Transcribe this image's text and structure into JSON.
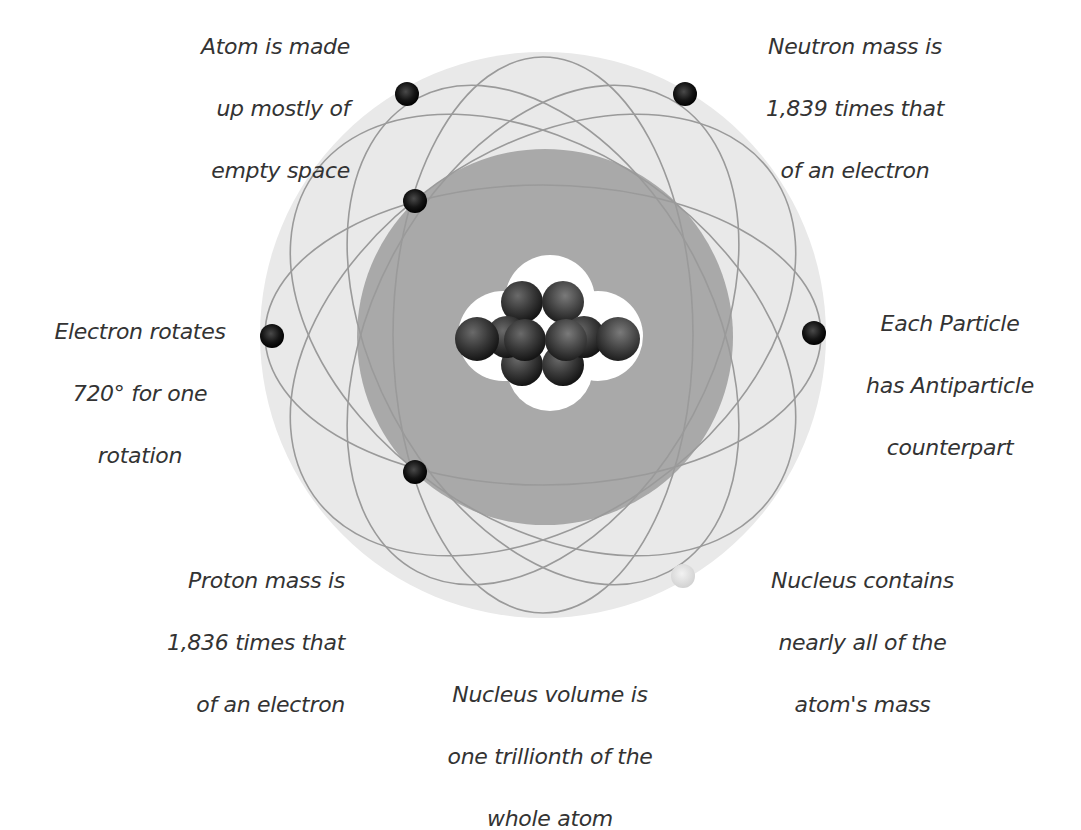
{
  "diagram": {
    "colors": {
      "background": "#ffffff",
      "outer_cloud": "#e9e9e9",
      "inner_cloud": "#a8a8a8",
      "orbit_line": "#9a9a9a",
      "nucleus_halo": "#ffffff",
      "particle": "#2a2a2a",
      "electron": "#111111",
      "faded_electron": "#dcdcdc",
      "text": "#333333"
    },
    "captions": [
      {
        "id": "empty-space",
        "lines": [
          "Atom is made",
          "up mostly of",
          "empty space"
        ]
      },
      {
        "id": "neutron-mass",
        "lines": [
          "Neutron mass is",
          "1,839 times that",
          "of an electron"
        ]
      },
      {
        "id": "electron-rotation",
        "lines": [
          "Electron rotates",
          "720° for one",
          "rotation"
        ]
      },
      {
        "id": "antiparticle",
        "lines": [
          "Each Particle",
          "has Antiparticle",
          "counterpart"
        ]
      },
      {
        "id": "proton-mass",
        "lines": [
          "Proton mass is",
          "1,836 times that",
          "of an electron"
        ]
      },
      {
        "id": "nucleus-mass",
        "lines": [
          "Nucleus contains",
          "nearly all of the",
          "atom's mass"
        ]
      },
      {
        "id": "nucleus-volume",
        "lines": [
          "Nucleus volume is",
          "one trillionth of the",
          "whole atom"
        ]
      }
    ]
  }
}
